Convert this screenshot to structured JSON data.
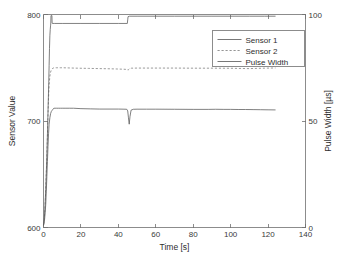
{
  "chart_data": {
    "type": "line",
    "title": "",
    "xlabel": "Time [s]",
    "ylabel": "Sensor Value",
    "y2label": "Pulse Width [µs]",
    "xlim": [
      0,
      140
    ],
    "ylim": [
      600,
      800
    ],
    "y2lim": [
      0,
      100
    ],
    "xticks": [
      0,
      20,
      40,
      60,
      80,
      100,
      120,
      140
    ],
    "xticklabels": [
      "0",
      "20",
      "40",
      "60",
      "80",
      "100",
      "120",
      "140"
    ],
    "yticks": [
      600,
      700,
      800
    ],
    "yticklabels": [
      "600",
      "700",
      "800"
    ],
    "y2ticks": [
      0,
      50,
      100
    ],
    "y2ticklabels": [
      "0",
      "50",
      "100"
    ],
    "grid": false,
    "legend_position": "top-right",
    "legend_entries": [
      "Sensor 1",
      "Sensor 2",
      "Pulse Width"
    ],
    "series": [
      {
        "name": "Sensor 1",
        "axis": "left",
        "style": "solid",
        "color": "#565656",
        "x": [
          0.0,
          0.3,
          0.6,
          0.9,
          1.2,
          1.5,
          1.8,
          2.1,
          2.4,
          2.7,
          3.0,
          3.4,
          3.8,
          4.2,
          4.6,
          5.0,
          5.6,
          6.2,
          7.0,
          8.0,
          9.0,
          10.0,
          12.0,
          14.0,
          16.0,
          20.0,
          25.0,
          30.0,
          35.0,
          40.0,
          43.0,
          44.5,
          45.0,
          45.4,
          45.8,
          46.2,
          46.8,
          48.0,
          50.0,
          55.0,
          60.0,
          70.0,
          80.0,
          88.0,
          92.0,
          96.0,
          100.0,
          104.0,
          108.0,
          112.0,
          116.0,
          120.0,
          124.0
        ],
        "y": [
          602,
          604,
          608,
          614,
          622,
          634,
          648,
          662,
          676,
          688,
          697,
          703,
          707,
          709,
          710,
          711,
          712,
          712,
          712,
          712,
          712,
          712,
          712,
          712,
          712,
          711.6,
          711.4,
          711.2,
          711.2,
          711.2,
          711.1,
          711.0,
          709.5,
          703.0,
          697.0,
          704.0,
          710.2,
          711.0,
          711.1,
          711.1,
          711.1,
          711.0,
          710.9,
          710.9,
          711.0,
          710.9,
          710.9,
          710.8,
          710.8,
          710.7,
          710.6,
          710.5,
          710.4
        ]
      },
      {
        "name": "Sensor 2",
        "axis": "left",
        "style": "dashed",
        "color": "#7a7a7a",
        "x": [
          0.0,
          0.3,
          0.6,
          0.9,
          1.2,
          1.5,
          1.8,
          2.1,
          2.4,
          2.7,
          3.0,
          3.4,
          3.8,
          4.2,
          4.6,
          5.0,
          5.6,
          6.2,
          7.0,
          8.0,
          9.0,
          10.0,
          14.0,
          18.0,
          24.0,
          30.0,
          36.0,
          40.0,
          43.0,
          44.5,
          45.2,
          46.0,
          47.0,
          50.0,
          55.0,
          62.0,
          70.0,
          80.0,
          90.0,
          100.0,
          106.0,
          110.0,
          114.0,
          118.0,
          121.0,
          124.0
        ],
        "y": [
          603,
          606,
          612,
          622,
          636,
          652,
          668,
          686,
          706,
          722,
          734,
          742,
          746,
          748,
          749,
          749.5,
          750,
          750,
          750,
          750,
          750,
          750,
          749.8,
          749.6,
          749.4,
          749.2,
          749.0,
          748.8,
          748.6,
          748.4,
          747.8,
          749.2,
          749.6,
          749.7,
          749.7,
          749.7,
          749.7,
          749.6,
          749.6,
          749.5,
          749.3,
          749.2,
          749.4,
          749.6,
          749.7,
          749.8
        ]
      },
      {
        "name": "Pulse Width",
        "axis": "right",
        "style": "solid",
        "color": "#565656",
        "x": [
          0.0,
          0.4,
          0.8,
          1.2,
          1.6,
          2.0,
          2.4,
          2.8,
          3.0,
          3.2,
          3.4,
          3.6,
          3.8,
          3.9,
          4.0,
          4.1,
          4.3,
          4.5,
          4.6,
          4.7,
          5.0,
          6.0,
          10.0,
          20.0,
          30.0,
          40.0,
          44.8,
          45.0,
          45.2,
          46.0,
          50.0,
          60.0,
          70.0,
          80.0,
          90.0,
          100.0,
          110.0,
          118.0,
          124.0
        ],
        "y": [
          1.0,
          4.0,
          10.0,
          18.0,
          28.0,
          40.0,
          54.0,
          68.0,
          76.0,
          84.0,
          90.0,
          93.0,
          95.0,
          96.0,
          99.5,
          99.5,
          99.5,
          99.5,
          96.0,
          95.8,
          95.8,
          95.8,
          95.8,
          95.8,
          95.8,
          95.8,
          95.8,
          97.5,
          99.0,
          99.2,
          99.2,
          99.2,
          99.2,
          99.2,
          99.2,
          99.2,
          99.2,
          99.2,
          99.2
        ]
      }
    ]
  },
  "colors": {
    "axis": "#6f6f6f",
    "text": "#2e2e2e",
    "background": "#ffffff",
    "series_1": "#565656",
    "series_2": "#7a7a7a",
    "series_3": "#565656"
  }
}
